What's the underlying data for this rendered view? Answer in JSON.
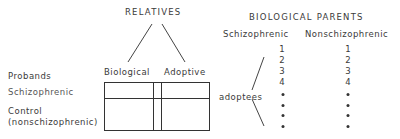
{
  "left_diagram": {
    "title": "RELATIVES",
    "column_headers": [
      "Biological",
      "Adoptive"
    ],
    "row_header_label": "Probands",
    "rows": [
      {
        "label": "Schizophrenic"
      },
      {
        "label_line1": "Control",
        "label_line2": "(nonschizophrenic)"
      }
    ]
  },
  "right_diagram": {
    "title": "BIOLOGICAL PARENTS",
    "column_headers": [
      "Schizophrenic",
      "Nonschizophrenic"
    ],
    "bracket_label": "adoptees",
    "schizophrenic_list": [
      "1",
      "2",
      "3",
      "4"
    ],
    "nonschizophrenic_list": [
      "1",
      "2",
      "3",
      "4"
    ],
    "continuation_dots": 4
  }
}
